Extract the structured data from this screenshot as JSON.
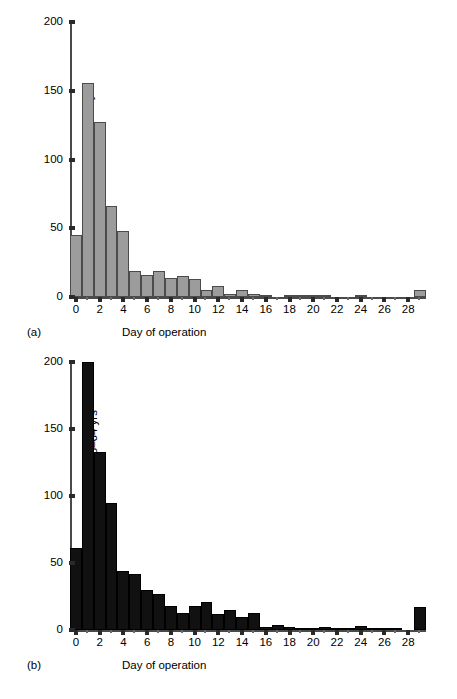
{
  "figure": {
    "panel_a_tag": "(a)",
    "panel_b_tag": "(b)"
  },
  "chart_data": [
    {
      "type": "bar",
      "id": "panel-a",
      "title": "",
      "panel_label": "(a)",
      "xlabel": "Day of operation",
      "ylabel": "No. of patients: aged < 45 yrs",
      "ylim": [
        0,
        200
      ],
      "xlim": [
        -0.5,
        29.5
      ],
      "yticks": [
        0,
        50,
        100,
        150,
        200
      ],
      "ytick_labels": [
        "0",
        "50",
        "100",
        "150",
        "200"
      ],
      "xticks": [
        0,
        2,
        4,
        6,
        8,
        10,
        12,
        14,
        16,
        18,
        20,
        22,
        24,
        26,
        28
      ],
      "xtick_labels": [
        "0",
        "2",
        "4",
        "6",
        "8",
        "10",
        "12",
        "14",
        "16",
        "18",
        "20",
        "22",
        "24",
        "26",
        "28"
      ],
      "grid": false,
      "legend": false,
      "bar_fill": "#9c9c9c",
      "bar_stroke": "#4b4b4b",
      "categories": [
        0,
        1,
        2,
        3,
        4,
        5,
        6,
        7,
        8,
        9,
        10,
        11,
        12,
        13,
        14,
        15,
        16,
        17,
        18,
        19,
        20,
        21,
        22,
        23,
        24,
        25,
        26,
        27,
        28,
        29
      ],
      "values": [
        45,
        156,
        127,
        66,
        48,
        19,
        16,
        19,
        14,
        15,
        13,
        5,
        8,
        2,
        5,
        2,
        1,
        0,
        1,
        0.5,
        0.5,
        0.3,
        0,
        0,
        1,
        0,
        0,
        0,
        0,
        5
      ]
    },
    {
      "type": "bar",
      "id": "panel-b",
      "title": "",
      "panel_label": "(b)",
      "xlabel": "Day of operation",
      "ylabel": "No. of patients: aged 45–64 yrs",
      "ylim": [
        0,
        200
      ],
      "xlim": [
        -0.5,
        29.5
      ],
      "yticks": [
        0,
        50,
        100,
        150,
        200
      ],
      "ytick_labels": [
        "0",
        "50",
        "100",
        "150",
        "200"
      ],
      "xticks": [
        0,
        2,
        4,
        6,
        8,
        10,
        12,
        14,
        16,
        18,
        20,
        22,
        24,
        26,
        28
      ],
      "xtick_labels": [
        "0",
        "2",
        "4",
        "6",
        "8",
        "10",
        "12",
        "14",
        "16",
        "18",
        "20",
        "22",
        "24",
        "26",
        "28"
      ],
      "grid": false,
      "legend": false,
      "bar_fill": "#111111",
      "bar_stroke": "#000000",
      "categories": [
        0,
        1,
        2,
        3,
        4,
        5,
        6,
        7,
        8,
        9,
        10,
        11,
        12,
        13,
        14,
        15,
        16,
        17,
        18,
        19,
        20,
        21,
        22,
        23,
        24,
        25,
        26,
        27,
        28,
        29
      ],
      "values": [
        61,
        200,
        133,
        95,
        44,
        42,
        30,
        27,
        18,
        13,
        18,
        21,
        12,
        15,
        10,
        13,
        2,
        4,
        2,
        1,
        0.5,
        2,
        1,
        0.5,
        3,
        0.5,
        0.5,
        1,
        0,
        17
      ]
    }
  ]
}
